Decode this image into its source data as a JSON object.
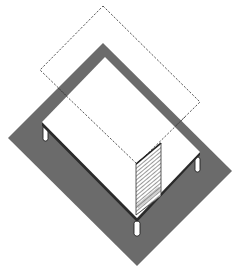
{
  "figure": {
    "title": "Isometric table on ground footprint with dashed projection outline"
  },
  "colors": {
    "background": "#ffffff",
    "footprint": "#6b6b6b",
    "tabletop": "#ffffff",
    "edge": "#2a2a2a",
    "dashed": "#444444",
    "hatch": "#555555",
    "leg": "#ffffff"
  },
  "elements": {
    "footprint": {
      "points": "103,43 232,171 137,266 8,138"
    },
    "tabletop": {
      "points": "105,57 200,152 137,218 42,122"
    },
    "dashed_outline": {
      "points": "103,6 200,102 137,164 40,70"
    },
    "hatched_panel": {
      "points": "136,164 161,143 161,196 136,215"
    },
    "legs": [
      {
        "name": "left",
        "x": 43,
        "y": 126,
        "w": 5,
        "h": 15
      },
      {
        "name": "right",
        "x": 195,
        "y": 157,
        "w": 5,
        "h": 15
      },
      {
        "name": "front",
        "x": 134,
        "y": 221,
        "w": 6,
        "h": 15
      }
    ]
  }
}
